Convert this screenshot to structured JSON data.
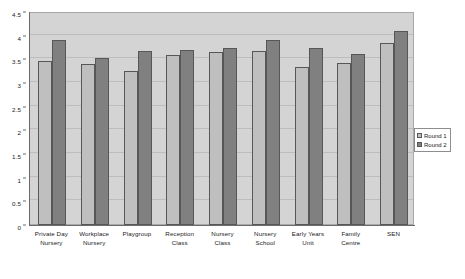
{
  "chart_data": {
    "type": "bar",
    "title": "",
    "subtitle": "",
    "xlabel": "",
    "ylabel": "",
    "ylim": [
      0,
      4.5
    ],
    "ytick_labels": [
      "0",
      "0.5",
      "1",
      "1.5",
      "2",
      "2.5",
      "3",
      "3.5",
      "4",
      "4.5"
    ],
    "ytick_values": [
      0,
      0.5,
      1,
      1.5,
      2,
      2.5,
      3,
      3.5,
      4,
      4.5
    ],
    "grid": true,
    "legend_position": "right",
    "categories": [
      "Private Day Nursery",
      "Workplace Nursery",
      "Playgroup",
      "Reception Class",
      "Nursery Class",
      "Nursery School",
      "Early Years Unit",
      "Family Centre",
      "SEN"
    ],
    "category_lines": [
      [
        "Private Day",
        "Nursery"
      ],
      [
        "Workplace",
        "Nursery"
      ],
      [
        "Playgroup"
      ],
      [
        "Reception",
        "Class"
      ],
      [
        "Nursery",
        "Class"
      ],
      [
        "Nursery",
        "School"
      ],
      [
        "Early Years",
        "Unit"
      ],
      [
        "Family",
        "Centre"
      ],
      [
        "SEN"
      ]
    ],
    "series": [
      {
        "name": "Round 1",
        "color": "#bfbfbf",
        "values": [
          3.47,
          3.41,
          3.26,
          3.59,
          3.66,
          3.68,
          3.34,
          3.43,
          3.84
        ]
      },
      {
        "name": "Round 2",
        "color": "#808080",
        "values": [
          3.9,
          3.53,
          3.68,
          3.7,
          3.74,
          3.9,
          3.73,
          3.62,
          4.1
        ]
      }
    ]
  },
  "legend": {
    "items": [
      {
        "label": "Round 1",
        "color": "#bfbfbf"
      },
      {
        "label": "Round 2",
        "color": "#808080"
      }
    ]
  },
  "colors": {
    "plot_background": "#d4d4d4",
    "gridline": "#bdbdbd",
    "axis": "#6b6b6b",
    "bar_border": "#575757",
    "text": "#1a1a1a",
    "page_background": "#ffffff"
  }
}
